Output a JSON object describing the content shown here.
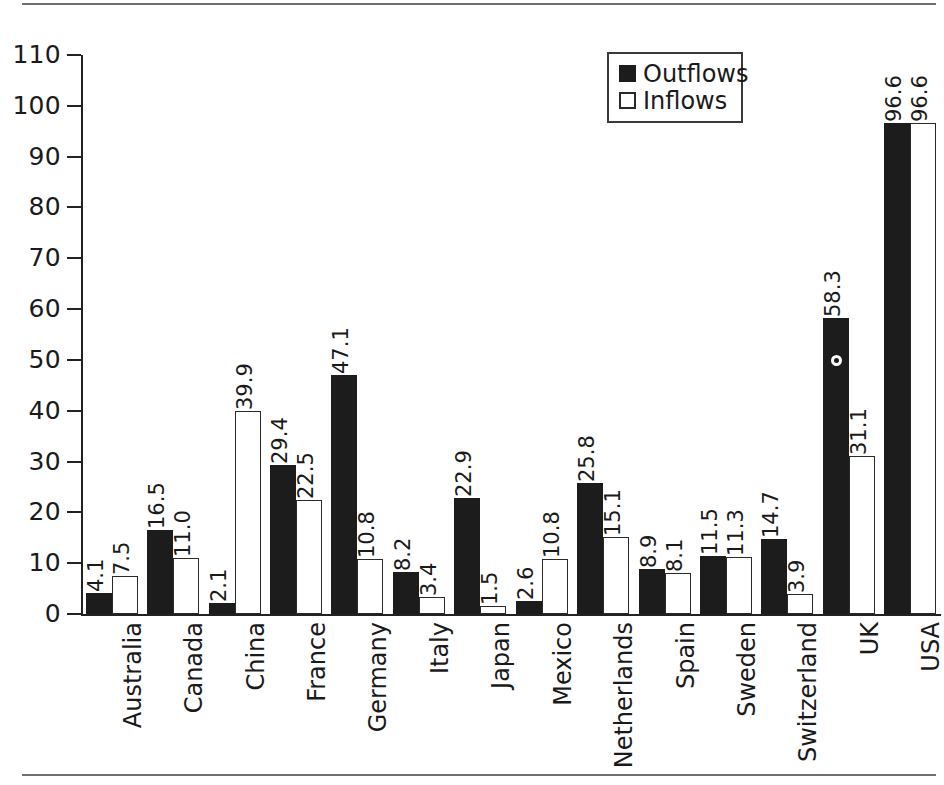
{
  "figure": {
    "rules": {
      "top": "horizontal-rule",
      "bottom": "horizontal-rule"
    }
  },
  "legend": {
    "position": "top-right",
    "entries": [
      {
        "label": "Outflows",
        "swatch": "filled-black-square"
      },
      {
        "label": "Inflows",
        "swatch": "open-white-square"
      }
    ]
  },
  "colors": {
    "outflows": "#1c1c1c",
    "inflows": "#ffffff",
    "inflows_border": "#2a2a2a",
    "axis": "#222222",
    "rule": "#6f6f6f",
    "text": "#1a1a1a"
  },
  "chart_data": {
    "type": "bar",
    "title": "",
    "subtitle": "",
    "xlabel": "",
    "ylabel": "",
    "ylim": [
      0,
      110
    ],
    "yticks": [
      0,
      10,
      20,
      30,
      40,
      50,
      60,
      70,
      80,
      90,
      100,
      110
    ],
    "ytick_labels": [
      "0",
      "10",
      "20",
      "30",
      "40",
      "50",
      "60",
      "70",
      "80",
      "90",
      "100",
      "110"
    ],
    "grid": false,
    "legend_position": "upper right",
    "orientation": "vertical",
    "category_label_rotation": 90,
    "value_label_rotation": 90,
    "categories": [
      "Australia",
      "Canada",
      "China",
      "France",
      "Germany",
      "Italy",
      "Japan",
      "Mexico",
      "Netherlands",
      "Spain",
      "Sweden",
      "Switzerland",
      "UK",
      "USA"
    ],
    "series": [
      {
        "name": "Outflows",
        "color": "#1c1c1c",
        "values": [
          4.1,
          16.5,
          2.1,
          29.4,
          47.1,
          8.2,
          22.9,
          2.6,
          25.8,
          8.9,
          11.5,
          14.7,
          58.3,
          96.6
        ],
        "value_labels": [
          "4.1",
          "16.5",
          "2.1",
          "29.4",
          "47.1",
          "8.2",
          "22.9",
          "2.6",
          "25.8",
          "8.9",
          "11.5",
          "14.7",
          "58.3",
          "96.6"
        ]
      },
      {
        "name": "Inflows",
        "color": "#ffffff",
        "values": [
          7.5,
          11.0,
          39.9,
          22.5,
          10.8,
          3.4,
          1.5,
          10.8,
          15.1,
          8.1,
          11.3,
          3.9,
          31.1,
          96.6
        ],
        "value_labels": [
          "7.5",
          "11.0",
          "39.9",
          "22.5",
          "10.8",
          "3.4",
          "1.5",
          "10.8",
          "15.1",
          "8.1",
          "11.3",
          "3.9",
          "31.1",
          "96.6"
        ]
      }
    ],
    "annotations": [
      {
        "name": "scan-speck",
        "on_category": "UK",
        "on_series": "Outflows",
        "value_position": 50.0
      }
    ]
  }
}
